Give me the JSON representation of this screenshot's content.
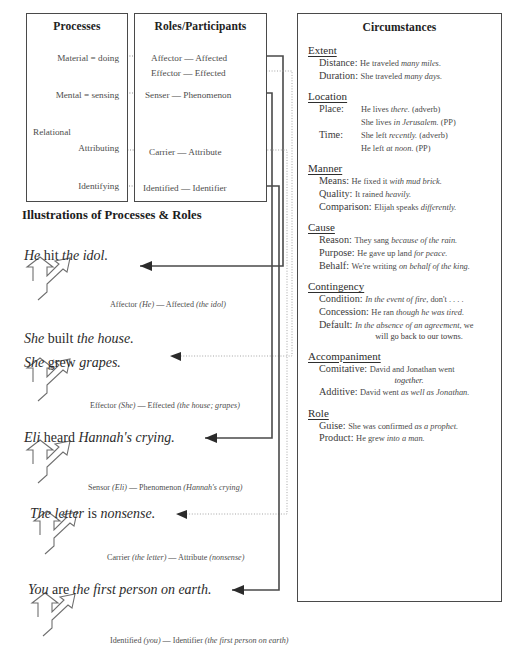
{
  "panels": {
    "processes": {
      "title": "Processes",
      "rows": [
        {
          "label": "Material = doing",
          "top": 52
        },
        {
          "label": "Mental = sensing",
          "top": 89
        },
        {
          "label": "Relational",
          "top": 126
        },
        {
          "label": "Attributing",
          "top": 142
        },
        {
          "label": "Identifying",
          "top": 180
        }
      ]
    },
    "roles": {
      "title": "Roles/Participants",
      "rows": [
        {
          "label": "Affector — Affected",
          "top": 52
        },
        {
          "label": "Effector — Effected",
          "top": 67
        },
        {
          "label": "Senser — Phenomenon",
          "top": 89
        },
        {
          "label": "Carrier — Attribute",
          "top": 146
        },
        {
          "label": "Identified — Identifier",
          "top": 182
        }
      ]
    },
    "circumstances": {
      "title": "Circumstances",
      "groups": [
        {
          "head": "Extent",
          "items": [
            {
              "label": "Distance:",
              "example": "He traveled ",
              "emph": "many miles."
            },
            {
              "label": "Duration:",
              "example": "She traveled ",
              "emph": "many days."
            }
          ]
        },
        {
          "head": "Location",
          "items": [
            {
              "label": "Place:",
              "example": "He lives ",
              "emph": "there.",
              "tail": " (adverb)",
              "example2": "She lives ",
              "emph2": "in Jerusalem.",
              "tail2": " (PP)"
            },
            {
              "label": "Time:",
              "example": "She left ",
              "emph": "recently.",
              "tail": " (adverb)",
              "example2": "He left ",
              "emph2": "at noon.",
              "tail2": " (PP)"
            }
          ]
        },
        {
          "head": "Manner",
          "items": [
            {
              "label": "Means:",
              "example": "He fixed it ",
              "emph": "with mud brick."
            },
            {
              "label": "Quality:",
              "example": "It rained ",
              "emph": "heavily."
            },
            {
              "label": "Comparison:",
              "example": "Elijah speaks ",
              "emph": "differently."
            }
          ]
        },
        {
          "head": "Cause",
          "items": [
            {
              "label": "Reason:",
              "example": "They sang ",
              "emph": "because of the rain."
            },
            {
              "label": "Purpose:",
              "example": "He gave up land ",
              "emph": "for peace."
            },
            {
              "label": "Behalf:",
              "example": "We're writing ",
              "emph": "on behalf of the king."
            }
          ]
        },
        {
          "head": "Contingency",
          "items": [
            {
              "label": "Condition:",
              "emphFirst": "In the event of fire",
              "example": ", don't . . . ."
            },
            {
              "label": "Concession:",
              "example": "He ran ",
              "emph": "though he was tired."
            },
            {
              "label": "Default:",
              "emphFirst": "In the absence of an agreement",
              "example": ", we",
              "cont": "will go back to our towns."
            }
          ]
        },
        {
          "head": "Accompaniment",
          "items": [
            {
              "label": "Comitative:",
              "example": "David and Jonathan went",
              "cont2": "together."
            },
            {
              "label": "Additive:",
              "example": "David went ",
              "emph": "as well as Jonathan."
            }
          ]
        },
        {
          "head": "Role",
          "items": [
            {
              "label": "Guise:",
              "example": "She was confirmed ",
              "emph": "as a prophet."
            },
            {
              "label": "Product:",
              "example": "He grew ",
              "emph": "into a man."
            }
          ]
        }
      ]
    }
  },
  "illustrations": {
    "title": "Illustrations of Processes & Roles",
    "examples": [
      {
        "sentence_parts": [
          {
            "t": "He",
            "i": true
          },
          {
            "t": " hit ",
            "i": false
          },
          {
            "t": "the idol.",
            "i": true
          }
        ],
        "sentence_top": 248,
        "role_plain1": "Affector ",
        "role_em1": "(He)",
        "role_dash": " — ",
        "role_plain2": "Affected ",
        "role_em2": "(the idol)",
        "role_top": 300,
        "role_left": 110
      },
      {
        "sentence_parts": [
          {
            "t": "She",
            "i": true
          },
          {
            "t": " built ",
            "i": false
          },
          {
            "t": "the house.",
            "i": true
          }
        ],
        "sentence_top": 331,
        "sentence2_parts": [
          {
            "t": "She",
            "i": true
          },
          {
            "t": " grew ",
            "i": false
          },
          {
            "t": "grapes.",
            "i": true
          }
        ],
        "sentence2_top": 355,
        "role_plain1": "Effector ",
        "role_em1": "(She)",
        "role_dash": " — ",
        "role_plain2": "Effected ",
        "role_em2": "(the house; grapes)",
        "role_top": 401,
        "role_left": 90
      },
      {
        "sentence_parts": [
          {
            "t": "Eli",
            "i": true
          },
          {
            "t": " heard ",
            "i": false
          },
          {
            "t": "Hannah's crying.",
            "i": true
          }
        ],
        "sentence_top": 430,
        "role_plain1": "Sensor ",
        "role_em1": "(Eli)",
        "role_dash": " — ",
        "role_plain2": "Phenomenon ",
        "role_em2": "(Hannah's crying)",
        "role_top": 483,
        "role_left": 88
      },
      {
        "sentence_parts": [
          {
            "t": "The letter",
            "i": true
          },
          {
            "t": " is ",
            "i": false
          },
          {
            "t": "nonsense.",
            "i": true
          }
        ],
        "sentence_top": 506,
        "role_plain1": "Carrier ",
        "role_em1": "(the letter)",
        "role_dash": " — ",
        "role_plain2": "Attribute ",
        "role_em2": "(nonsense)",
        "role_top": 553,
        "role_left": 107
      },
      {
        "sentence_parts": [
          {
            "t": "You",
            "i": true
          },
          {
            "t": " are ",
            "i": false
          },
          {
            "t": "the first person on earth.",
            "i": true
          }
        ],
        "sentence_top": 582,
        "role_plain1": "Identified ",
        "role_em1": "(you)",
        "role_dash": " — ",
        "role_plain2": "Identifier ",
        "role_em2": "(the first person on earth)",
        "role_top": 636,
        "role_left": 110
      }
    ]
  }
}
